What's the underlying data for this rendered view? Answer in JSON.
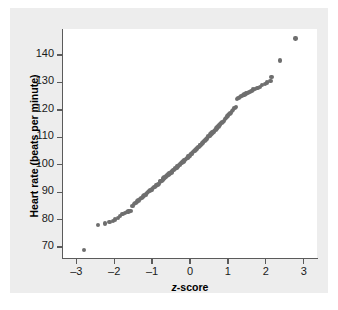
{
  "figure": {
    "background": "#ffffff",
    "panel_color": "#ededed",
    "plot_background": "#ffffff",
    "axis_color": "#5b5b5b",
    "marker_color": "#6e6e6e"
  },
  "labels": {
    "xlabel_italic": "z",
    "xlabel_rest": "-score",
    "ylabel": "Heart rate (beats per minute)"
  },
  "chart_data": {
    "type": "scatter",
    "title": "",
    "xlabel": "z-score",
    "ylabel": "Heart rate (beats per minute)",
    "xlim": [
      -3.35,
      3.35
    ],
    "ylim": [
      66.0,
      149.5
    ],
    "xticks": [
      -3,
      -2,
      -1,
      0,
      1,
      2,
      3
    ],
    "xticklabels": [
      "–3",
      "–2",
      "–1",
      "0",
      "1",
      "2",
      "3"
    ],
    "yticks": [
      70,
      80,
      90,
      100,
      110,
      120,
      130,
      140
    ],
    "yticklabels": [
      "70",
      "80",
      "90",
      "100",
      "110",
      "120",
      "130",
      "140"
    ],
    "grid": false,
    "legend": null,
    "series": [
      {
        "name": "Heart rate normal probability plot",
        "marker": "circle",
        "color": "#6e6e6e",
        "x": [
          -2.8,
          -2.42,
          -2.25,
          -2.12,
          -2.04,
          -1.97,
          -1.9,
          -1.84,
          -1.78,
          -1.72,
          -1.67,
          -1.62,
          -1.57,
          -1.52,
          -1.48,
          -1.44,
          -1.4,
          -1.36,
          -1.32,
          -1.28,
          -1.24,
          -1.21,
          -1.17,
          -1.14,
          -1.1,
          -1.07,
          -1.04,
          -1.01,
          -0.98,
          -0.95,
          -0.92,
          -0.89,
          -0.86,
          -0.83,
          -0.8,
          -0.78,
          -0.75,
          -0.72,
          -0.7,
          -0.67,
          -0.64,
          -0.62,
          -0.59,
          -0.57,
          -0.54,
          -0.52,
          -0.49,
          -0.47,
          -0.45,
          -0.42,
          -0.4,
          -0.38,
          -0.35,
          -0.33,
          -0.31,
          -0.28,
          -0.26,
          -0.24,
          -0.22,
          -0.19,
          -0.17,
          -0.15,
          -0.13,
          -0.11,
          -0.08,
          -0.06,
          -0.04,
          -0.02,
          0.0,
          0.02,
          0.04,
          0.06,
          0.08,
          0.11,
          0.13,
          0.15,
          0.17,
          0.19,
          0.22,
          0.24,
          0.26,
          0.28,
          0.31,
          0.33,
          0.35,
          0.38,
          0.4,
          0.42,
          0.45,
          0.47,
          0.49,
          0.52,
          0.54,
          0.57,
          0.59,
          0.62,
          0.64,
          0.67,
          0.7,
          0.72,
          0.75,
          0.78,
          0.8,
          0.83,
          0.86,
          0.89,
          0.92,
          0.95,
          0.98,
          1.01,
          1.04,
          1.07,
          1.1,
          1.14,
          1.17,
          1.21,
          1.24,
          1.28,
          1.32,
          1.36,
          1.4,
          1.44,
          1.48,
          1.52,
          1.57,
          1.62,
          1.67,
          1.72,
          1.78,
          1.84,
          1.9,
          1.97,
          2.04,
          2.12,
          2.15,
          2.37,
          2.78
        ],
        "y": [
          69.0,
          78.0,
          78.6,
          79.2,
          79.4,
          80.0,
          80.6,
          81.2,
          82.0,
          82.4,
          82.8,
          83.0,
          83.2,
          85.0,
          85.6,
          86.0,
          86.6,
          87.0,
          87.4,
          88.0,
          88.4,
          88.8,
          89.2,
          89.6,
          90.0,
          90.4,
          90.8,
          91.0,
          91.4,
          91.8,
          92.0,
          92.4,
          92.6,
          93.0,
          93.6,
          94.0,
          94.2,
          94.6,
          95.0,
          95.4,
          95.6,
          96.0,
          96.2,
          96.4,
          96.8,
          97.0,
          97.2,
          97.6,
          98.0,
          98.2,
          98.4,
          98.8,
          99.0,
          99.4,
          99.6,
          100.0,
          100.2,
          100.6,
          100.8,
          101.0,
          101.2,
          101.6,
          101.8,
          102.0,
          102.4,
          102.6,
          103.0,
          103.2,
          103.4,
          103.8,
          104.0,
          104.4,
          104.6,
          105.0,
          105.2,
          105.4,
          105.8,
          106.0,
          106.4,
          106.6,
          107.0,
          107.2,
          107.6,
          108.0,
          108.2,
          108.6,
          109.0,
          109.2,
          109.6,
          110.0,
          110.4,
          110.6,
          111.0,
          111.4,
          111.8,
          112.0,
          112.4,
          112.8,
          113.2,
          113.6,
          114.0,
          114.4,
          114.8,
          115.2,
          115.6,
          116.0,
          116.6,
          117.0,
          117.6,
          118.0,
          118.6,
          119.0,
          119.6,
          120.0,
          120.6,
          121.0,
          124.0,
          124.4,
          124.8,
          125.0,
          125.4,
          125.6,
          126.0,
          126.2,
          126.6,
          127.0,
          127.4,
          127.6,
          128.0,
          128.4,
          129.0,
          129.4,
          130.0,
          130.6,
          132.0,
          138.0,
          146.0
        ]
      }
    ]
  }
}
